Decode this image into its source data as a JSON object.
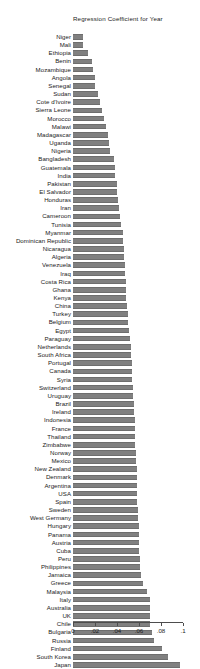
{
  "chart_data": {
    "type": "bar",
    "orientation": "horizontal",
    "title": "Regression Coefficient for Year",
    "xlabel": "",
    "ylabel": "",
    "xlim": [
      0,
      0.1
    ],
    "grid": false,
    "legend": "none",
    "bar_color": "#808080",
    "axis_color": "#4d4d4d",
    "background": "#ffffff",
    "tick_labels": [
      "0",
      ".02",
      ".04",
      ".06",
      ".08",
      ".1"
    ],
    "tick_values": [
      0,
      0.02,
      0.04,
      0.06,
      0.08,
      0.1
    ],
    "categories": [
      "Niger",
      "Mali",
      "Ethiopia",
      "Benin",
      "Mozambique",
      "Angola",
      "Senegal",
      "Sudan",
      "Cote d'Ivoire",
      "Sierra Leone",
      "Morocco",
      "Malawi",
      "Madagascar",
      "Uganda",
      "Nigeria",
      "Bangladesh",
      "Guatemala",
      "India",
      "Pakistan",
      "El Salvador",
      "Honduras",
      "Iran",
      "Cameroon",
      "Tunisia",
      "Myanmar",
      "Dominican Republic",
      "Nicaragua",
      "Algeria",
      "Venezuela",
      "Iraq",
      "Costa Rica",
      "Ghana",
      "Kenya",
      "China",
      "Turkey",
      "Belgium",
      "Egypt",
      "Paraguay",
      "Netherlands",
      "South Africa",
      "Portugal",
      "Canada",
      "Syria",
      "Switzerland",
      "Uruguay",
      "Brazil",
      "Ireland",
      "Indonesia",
      "France",
      "Thailand",
      "Zimbabwe",
      "Norway",
      "Mexico",
      "New Zealand",
      "Denmark",
      "Argentina",
      "USA",
      "Spain",
      "Sweden",
      "West Germany",
      "Hungary",
      "Panama",
      "Austria",
      "Cuba",
      "Peru",
      "Philippines",
      "Jamaica",
      "Greece",
      "Malaysia",
      "Italy",
      "Australia",
      "UK",
      "Chile",
      "Bulgaria",
      "Russia",
      "Finland",
      "South Korea",
      "Japan"
    ],
    "values": [
      0.0088,
      0.0094,
      0.0136,
      0.017,
      0.0186,
      0.0196,
      0.0204,
      0.0224,
      0.0248,
      0.0266,
      0.0286,
      0.03,
      0.0316,
      0.0328,
      0.034,
      0.0374,
      0.0378,
      0.0386,
      0.0398,
      0.0402,
      0.0408,
      0.0416,
      0.0424,
      0.0436,
      0.045,
      0.0456,
      0.0462,
      0.0466,
      0.047,
      0.0474,
      0.0478,
      0.0482,
      0.0486,
      0.0492,
      0.0498,
      0.0504,
      0.051,
      0.0516,
      0.0524,
      0.0528,
      0.0532,
      0.0536,
      0.054,
      0.0544,
      0.0548,
      0.0552,
      0.0556,
      0.056,
      0.0564,
      0.0566,
      0.0568,
      0.0572,
      0.0576,
      0.0578,
      0.058,
      0.0582,
      0.0584,
      0.0586,
      0.059,
      0.0592,
      0.0596,
      0.0598,
      0.06,
      0.0602,
      0.0606,
      0.061,
      0.0616,
      0.0634,
      0.067,
      0.0696,
      0.07,
      0.0702,
      0.0704,
      0.0722,
      0.074,
      0.081,
      0.086,
      0.097
    ]
  }
}
